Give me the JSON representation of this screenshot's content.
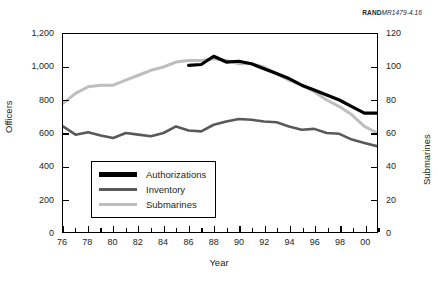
{
  "source_tag": {
    "brand": "RAND",
    "number": "MR1479-4.16"
  },
  "axis_titles": {
    "left": "Officers",
    "right": "Submarines",
    "bottom": "Year"
  },
  "legend": {
    "items": [
      {
        "label": "Authorizations",
        "color": "#000000"
      },
      {
        "label": "Inventory",
        "color": "#58595b"
      },
      {
        "label": "Submarines",
        "color": "#bcbec0"
      }
    ]
  },
  "chart_data": {
    "type": "line",
    "title": "",
    "subtitle": "",
    "xlabel": "Year",
    "ylabel": "Officers",
    "y2label": "Submarines",
    "grid": false,
    "legend_position": "inside-bottom-left",
    "xlim": [
      76,
      101
    ],
    "ylim": [
      0,
      1200
    ],
    "y2lim": [
      0,
      120
    ],
    "y_ticks": [
      0,
      200,
      400,
      600,
      800,
      1000,
      1200
    ],
    "y_tick_labels": [
      "0",
      "200",
      "400",
      "600",
      "800",
      "1,000",
      "1,200"
    ],
    "y2_ticks": [
      0,
      20,
      40,
      60,
      80,
      100,
      120
    ],
    "y2_tick_labels": [
      "0",
      "20",
      "40",
      "60",
      "80",
      "100",
      "120"
    ],
    "x_ticks": [
      76,
      77,
      78,
      79,
      80,
      81,
      82,
      83,
      84,
      85,
      86,
      87,
      88,
      89,
      90,
      91,
      92,
      93,
      94,
      95,
      96,
      97,
      98,
      99,
      100,
      101
    ],
    "x_tick_labels": [
      "76",
      "78",
      "80",
      "82",
      "84",
      "86",
      "88",
      "90",
      "92",
      "94",
      "96",
      "98",
      "00"
    ],
    "x_labeled_ticks": [
      76,
      78,
      80,
      82,
      84,
      86,
      88,
      90,
      92,
      94,
      96,
      98,
      100
    ],
    "series": [
      {
        "name": "Authorizations",
        "color": "#000000",
        "axis": "left",
        "x": [
          86,
          87,
          88,
          89,
          90,
          91,
          92,
          93,
          94,
          95,
          96,
          97,
          98,
          99,
          100,
          101
        ],
        "values": [
          1010,
          1015,
          1065,
          1030,
          1035,
          1020,
          990,
          960,
          930,
          890,
          860,
          830,
          800,
          760,
          720,
          720
        ]
      },
      {
        "name": "Inventory",
        "color": "#58595b",
        "axis": "left",
        "x": [
          76,
          77,
          78,
          79,
          80,
          81,
          82,
          83,
          84,
          85,
          86,
          87,
          88,
          89,
          90,
          91,
          92,
          93,
          94,
          95,
          96,
          97,
          98,
          99,
          100,
          101
        ],
        "values": [
          640,
          590,
          605,
          585,
          570,
          600,
          590,
          580,
          600,
          640,
          615,
          610,
          650,
          670,
          685,
          680,
          670,
          665,
          640,
          620,
          625,
          600,
          595,
          560,
          540,
          520
        ]
      },
      {
        "name": "Submarines",
        "color": "#bcbec0",
        "axis": "right",
        "x": [
          76,
          77,
          78,
          79,
          80,
          81,
          82,
          83,
          84,
          85,
          86,
          87,
          88,
          89,
          90,
          91,
          92,
          93,
          94,
          95,
          96,
          97,
          98,
          99,
          100,
          101
        ],
        "values": [
          78,
          84,
          88,
          89,
          89,
          92,
          95,
          98,
          100,
          103,
          104,
          104,
          105,
          104,
          102,
          102,
          100,
          96,
          92,
          89,
          85,
          80,
          76,
          71,
          64,
          60
        ]
      }
    ]
  }
}
